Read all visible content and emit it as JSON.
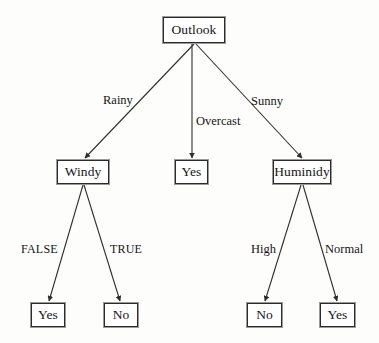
{
  "diagram": {
    "type": "decision-tree",
    "background_color": "#fdfdfc",
    "line_color": "#2f2f2f",
    "text_color": "#151515",
    "nodes": [
      {
        "id": "root",
        "label": "Outlook",
        "kind": "decision",
        "x": 163,
        "y": 17,
        "w": 62,
        "h": 26
      },
      {
        "id": "windy",
        "label": "Windy",
        "kind": "decision",
        "x": 57,
        "y": 160,
        "w": 52,
        "h": 24
      },
      {
        "id": "yes-mid",
        "label": "Yes",
        "kind": "leaf",
        "x": 175,
        "y": 160,
        "w": 33,
        "h": 24
      },
      {
        "id": "humidity",
        "label": "Huminidy",
        "kind": "decision",
        "x": 273,
        "y": 160,
        "w": 58,
        "h": 24
      },
      {
        "id": "yes-left",
        "label": "Yes",
        "kind": "leaf",
        "x": 31,
        "y": 303,
        "w": 34,
        "h": 24
      },
      {
        "id": "no-left",
        "label": "No",
        "kind": "leaf",
        "x": 104,
        "y": 303,
        "w": 34,
        "h": 24
      },
      {
        "id": "no-right",
        "label": "No",
        "kind": "leaf",
        "x": 247,
        "y": 303,
        "w": 35,
        "h": 24
      },
      {
        "id": "yes-right",
        "label": "Yes",
        "kind": "leaf",
        "x": 320,
        "y": 303,
        "w": 35,
        "h": 24
      }
    ],
    "edges": [
      {
        "id": "root-windy",
        "from": "root",
        "to": "windy",
        "label": "Rainy",
        "x1": 194,
        "y1": 44,
        "x2": 85,
        "y2": 158,
        "label_x": 103,
        "label_y": 94
      },
      {
        "id": "root-yes",
        "from": "root",
        "to": "yes-mid",
        "label": "Overcast",
        "x1": 192,
        "y1": 44,
        "x2": 192,
        "y2": 158,
        "label_x": 196,
        "label_y": 115
      },
      {
        "id": "root-humidity",
        "from": "root",
        "to": "humidity",
        "label": "Sunny",
        "x1": 196,
        "y1": 44,
        "x2": 302,
        "y2": 158,
        "label_x": 251,
        "label_y": 95
      },
      {
        "id": "windy-yes",
        "from": "windy",
        "to": "yes-left",
        "label": "FALSE",
        "x1": 83,
        "y1": 185,
        "x2": 49,
        "y2": 301,
        "label_x": 21,
        "label_y": 243
      },
      {
        "id": "windy-no",
        "from": "windy",
        "to": "no-left",
        "label": "TRUE",
        "x1": 84,
        "y1": 185,
        "x2": 120,
        "y2": 301,
        "label_x": 110,
        "label_y": 243
      },
      {
        "id": "humidity-no",
        "from": "humidity",
        "to": "no-right",
        "label": "High",
        "x1": 301,
        "y1": 185,
        "x2": 265,
        "y2": 301,
        "label_x": 251,
        "label_y": 243
      },
      {
        "id": "humidity-yes",
        "from": "humidity",
        "to": "yes-right",
        "label": "Normal",
        "x1": 303,
        "y1": 185,
        "x2": 337,
        "y2": 301,
        "label_x": 325,
        "label_y": 243
      }
    ]
  }
}
